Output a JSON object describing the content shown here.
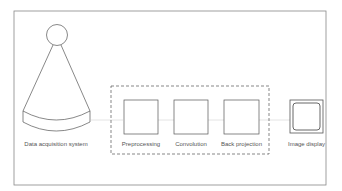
{
  "diagram": {
    "labels": {
      "acquisition": "Data acquisition system",
      "preprocessing": "Preprocessing",
      "convolution": "Convolution",
      "back_projection": "Back projection",
      "image_display": "Image display"
    }
  }
}
